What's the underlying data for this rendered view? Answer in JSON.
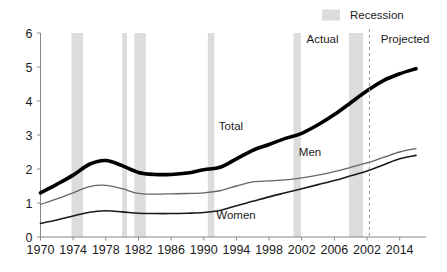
{
  "chart_data": {
    "type": "line",
    "title": "",
    "subtitle": "",
    "xlabel": "",
    "ylabel": "",
    "xlim": [
      1970,
      2016
    ],
    "ylim": [
      0,
      6
    ],
    "grid": false,
    "legend_position": "top-right",
    "y_ticks": [
      "0",
      "1",
      "2",
      "3",
      "4",
      "5",
      "6"
    ],
    "y_tick_values": [
      0,
      1,
      2,
      3,
      4,
      5,
      6
    ],
    "x_ticks": [
      "1970",
      "1974",
      "1978",
      "1982",
      "1986",
      "1990",
      "1994",
      "1998",
      "2002",
      "2006",
      "2002",
      "2014"
    ],
    "x_tick_values": [
      1970,
      1974,
      1978,
      1982,
      1986,
      1990,
      1994,
      1998,
      2002,
      2006,
      2010,
      2014
    ],
    "x": [
      1970,
      1972,
      1974,
      1976,
      1978,
      1980,
      1982,
      1984,
      1986,
      1988,
      1990,
      1992,
      1994,
      1996,
      1998,
      2000,
      2002,
      2004,
      2006,
      2008,
      2010,
      2012,
      2014,
      2016
    ],
    "series": [
      {
        "name": "Total",
        "label": "Total",
        "color": "#000000",
        "width": 3.6,
        "values": [
          1.3,
          1.55,
          1.82,
          2.14,
          2.25,
          2.1,
          1.9,
          1.84,
          1.84,
          1.88,
          1.98,
          2.05,
          2.3,
          2.55,
          2.72,
          2.9,
          3.05,
          3.3,
          3.6,
          3.95,
          4.3,
          4.6,
          4.8,
          4.95
        ]
      },
      {
        "name": "Men",
        "label": "Men",
        "color": "#666666",
        "width": 1.3,
        "values": [
          0.96,
          1.12,
          1.3,
          1.48,
          1.52,
          1.42,
          1.28,
          1.26,
          1.27,
          1.28,
          1.3,
          1.36,
          1.5,
          1.62,
          1.65,
          1.68,
          1.74,
          1.82,
          1.92,
          2.05,
          2.18,
          2.34,
          2.5,
          2.6
        ]
      },
      {
        "name": "Women",
        "label": "Women",
        "color": "#1a1a1a",
        "width": 1.6,
        "values": [
          0.4,
          0.5,
          0.62,
          0.73,
          0.77,
          0.74,
          0.7,
          0.69,
          0.69,
          0.7,
          0.72,
          0.78,
          0.92,
          1.05,
          1.18,
          1.3,
          1.42,
          1.54,
          1.66,
          1.8,
          1.94,
          2.12,
          2.3,
          2.4
        ]
      }
    ],
    "recession_bands": [
      {
        "start": 1973.8,
        "end": 1975.2
      },
      {
        "start": 1980.0,
        "end": 1980.6
      },
      {
        "start": 1981.5,
        "end": 1982.9
      },
      {
        "start": 1990.5,
        "end": 1991.3
      },
      {
        "start": 2001.0,
        "end": 2001.9
      },
      {
        "start": 2007.8,
        "end": 2009.5
      }
    ],
    "recession_color": "#dcdcdc",
    "divider_year": 2010.3,
    "annotations": [
      {
        "name": "actual",
        "text": "Actual",
        "x": 2007.0,
        "y": 5.72
      },
      {
        "name": "projected",
        "text": "Projected",
        "x": 2011.2,
        "y": 5.72
      }
    ],
    "legend": [
      {
        "label": "Recession",
        "color": "#dcdcdc",
        "type": "swatch"
      }
    ]
  },
  "series_label_positions": [
    {
      "name": "Total",
      "x": 231,
      "y": 130
    },
    {
      "name": "Men",
      "x": 310,
      "y": 156
    },
    {
      "name": "Women",
      "x": 236,
      "y": 219
    }
  ],
  "axis_color": "#888888",
  "background": "#ffffff"
}
